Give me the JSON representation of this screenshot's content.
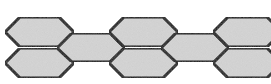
{
  "diagram": {
    "type": "hexagon-chain",
    "background": "#ffffff",
    "fill": "#d4d4d4",
    "stroke": "#111111",
    "stroke_width": 3,
    "hexagons": [
      {
        "id": "top-1",
        "points": "5,32 20,17 59,17 74,32 59,47 20,47"
      },
      {
        "id": "bottom-1",
        "points": "5,63 20,48 59,48 74,63 59,78 20,78"
      },
      {
        "id": "mid-1",
        "points": "57,48 72,33 110,33 125,48 110,62 72,62"
      },
      {
        "id": "top-2",
        "points": "109,32 124,17 163,17 178,32 163,47 124,47"
      },
      {
        "id": "bottom-2",
        "points": "109,63 124,48 163,48 178,63 163,78 124,78"
      },
      {
        "id": "mid-2",
        "points": "161,48 176,33 214,33 229,48 214,62 176,62"
      },
      {
        "id": "top-3",
        "points": "213,32 228,17 267,17 282,32 267,47 228,47"
      },
      {
        "id": "bottom-3",
        "points": "213,63 228,48 267,48 282,63 267,78 228,78"
      }
    ]
  }
}
